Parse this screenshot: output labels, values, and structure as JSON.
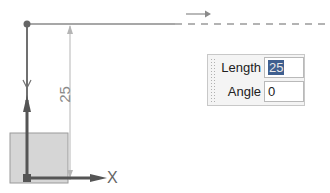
{
  "sketch": {
    "dimension_value": "25",
    "axis_x_label": "X",
    "colors": {
      "line": "#808080",
      "dim_line": "#b0b0b0",
      "axis": "#606060",
      "plane_fill": "#d0d0d0"
    }
  },
  "dialog": {
    "fields": [
      {
        "label": "Length",
        "value": "25",
        "selected": true
      },
      {
        "label": "Angle",
        "value": "0",
        "selected": false
      }
    ]
  }
}
